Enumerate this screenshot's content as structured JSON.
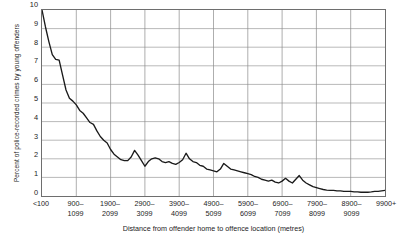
{
  "chart_data": {
    "type": "line",
    "title": "",
    "subtitle": "",
    "xlabel": "Distance from offender home to offence location (metres)",
    "ylabel": "Percent of police-recorded crimes by young offenders",
    "ylim": [
      0,
      10
    ],
    "yticks": [
      0,
      1,
      2,
      3,
      4,
      5,
      6,
      7,
      8,
      9,
      10
    ],
    "grid": true,
    "legend": null,
    "legend_position": "none",
    "categories": [
      "<100",
      "900–\n1099",
      "1900–\n2099",
      "2900–\n3099",
      "3900–\n4099",
      "4900–\n5099",
      "5900–\n6099",
      "6900–\n7099",
      "7900–\n8099",
      "8900–\n9099",
      "9900+"
    ],
    "xtick_labels": [
      {
        "line1": "<100",
        "line2": ""
      },
      {
        "line1": "900–",
        "line2": "1099"
      },
      {
        "line1": "1900–",
        "line2": "2099"
      },
      {
        "line1": "2900–",
        "line2": "3099"
      },
      {
        "line1": "3900–",
        "line2": "4099"
      },
      {
        "line1": "4900–",
        "line2": "5099"
      },
      {
        "line1": "5900–",
        "line2": "6099"
      },
      {
        "line1": "6900–",
        "line2": "7099"
      },
      {
        "line1": "7900–",
        "line2": "8099"
      },
      {
        "line1": "8900–",
        "line2": "9099"
      },
      {
        "line1": "9900+",
        "line2": ""
      }
    ],
    "series": [
      {
        "name": "Percent of police-recorded crimes by young offenders",
        "color": "#1a1a1a",
        "x": [
          0,
          1,
          2,
          3,
          4,
          5,
          6,
          7,
          8,
          9,
          10,
          11,
          12,
          13,
          14,
          15,
          16,
          17,
          18,
          19,
          20,
          21,
          22,
          23,
          24,
          25,
          26,
          27,
          28,
          29,
          30,
          31,
          32,
          33,
          34,
          35,
          36,
          37,
          38,
          39,
          40,
          41,
          42,
          43,
          44,
          45,
          46,
          47,
          48,
          49,
          50,
          51,
          52,
          53,
          54,
          55,
          56,
          57,
          58,
          59,
          60,
          61,
          62,
          63,
          64,
          65,
          66,
          67,
          68,
          69,
          70,
          71,
          72,
          73,
          74,
          75,
          76,
          77,
          78,
          79,
          80,
          81,
          82,
          83,
          84,
          85,
          86,
          87,
          88,
          89,
          90,
          91,
          92,
          93,
          94,
          95,
          96,
          97,
          98,
          99,
          100
        ],
        "values": [
          10.0,
          9.1,
          8.3,
          7.6,
          7.35,
          7.3,
          6.5,
          5.7,
          5.25,
          5.1,
          4.9,
          4.6,
          4.45,
          4.2,
          3.95,
          3.85,
          3.5,
          3.2,
          3.0,
          2.85,
          2.5,
          2.25,
          2.1,
          1.95,
          1.9,
          1.9,
          2.1,
          2.45,
          2.2,
          1.9,
          1.6,
          1.85,
          2.0,
          2.05,
          2.0,
          1.85,
          1.8,
          1.85,
          1.75,
          1.7,
          1.8,
          1.95,
          2.3,
          2.0,
          1.85,
          1.8,
          1.65,
          1.6,
          1.45,
          1.4,
          1.35,
          1.3,
          1.45,
          1.75,
          1.6,
          1.45,
          1.4,
          1.35,
          1.3,
          1.25,
          1.2,
          1.15,
          1.05,
          1.0,
          0.9,
          0.85,
          0.8,
          0.85,
          0.75,
          0.7,
          0.8,
          0.95,
          0.8,
          0.7,
          0.9,
          1.1,
          0.85,
          0.7,
          0.6,
          0.5,
          0.45,
          0.4,
          0.35,
          0.32,
          0.3,
          0.3,
          0.28,
          0.28,
          0.25,
          0.25,
          0.25,
          0.22,
          0.22,
          0.2,
          0.2,
          0.2,
          0.22,
          0.25,
          0.25,
          0.28,
          0.3
        ]
      }
    ]
  }
}
